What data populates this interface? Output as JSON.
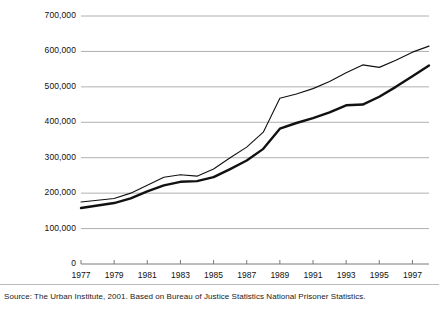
{
  "chart_data": {
    "type": "line",
    "title": "",
    "subtitle": "",
    "xlabel": "",
    "ylabel": "",
    "xlim": [
      1977,
      1998
    ],
    "ylim": [
      0,
      700000
    ],
    "grid": "horizontal",
    "legend": "none",
    "y_ticks": [
      0,
      100000,
      200000,
      300000,
      400000,
      500000,
      600000,
      700000
    ],
    "y_tick_labels": [
      "0",
      "100,000",
      "200,000",
      "300,000",
      "400,000",
      "500,000",
      "600,000",
      "700,000"
    ],
    "x_ticks": [
      1977,
      1979,
      1981,
      1983,
      1985,
      1987,
      1989,
      1991,
      1993,
      1995,
      1997
    ],
    "x_tick_labels": [
      "1977",
      "1979",
      "1981",
      "1983",
      "1985",
      "1987",
      "1989",
      "1991",
      "1993",
      "1995",
      "1997"
    ],
    "x": [
      1977,
      1978,
      1979,
      1980,
      1981,
      1982,
      1983,
      1984,
      1985,
      1986,
      1987,
      1988,
      1989,
      1990,
      1991,
      1992,
      1993,
      1994,
      1995,
      1996,
      1997,
      1998
    ],
    "series": [
      {
        "name": "upper-line",
        "color": "#111111",
        "width": 1.1,
        "values": [
          175000,
          180000,
          185000,
          200000,
          222000,
          245000,
          252000,
          248000,
          268000,
          300000,
          330000,
          372000,
          468000,
          480000,
          495000,
          515000,
          540000,
          562000,
          555000,
          575000,
          598000,
          615000
        ]
      },
      {
        "name": "lower-line",
        "color": "#111111",
        "width": 2.4,
        "values": [
          158000,
          165000,
          172000,
          185000,
          205000,
          222000,
          232000,
          234000,
          245000,
          268000,
          292000,
          325000,
          382000,
          398000,
          412000,
          428000,
          448000,
          450000,
          472000,
          500000,
          530000,
          560000
        ]
      }
    ],
    "annotations": []
  },
  "source": {
    "text": "Source: The Urban Institute, 2001. Based on Bureau of Justice Statistics National Prisoner Statistics."
  }
}
